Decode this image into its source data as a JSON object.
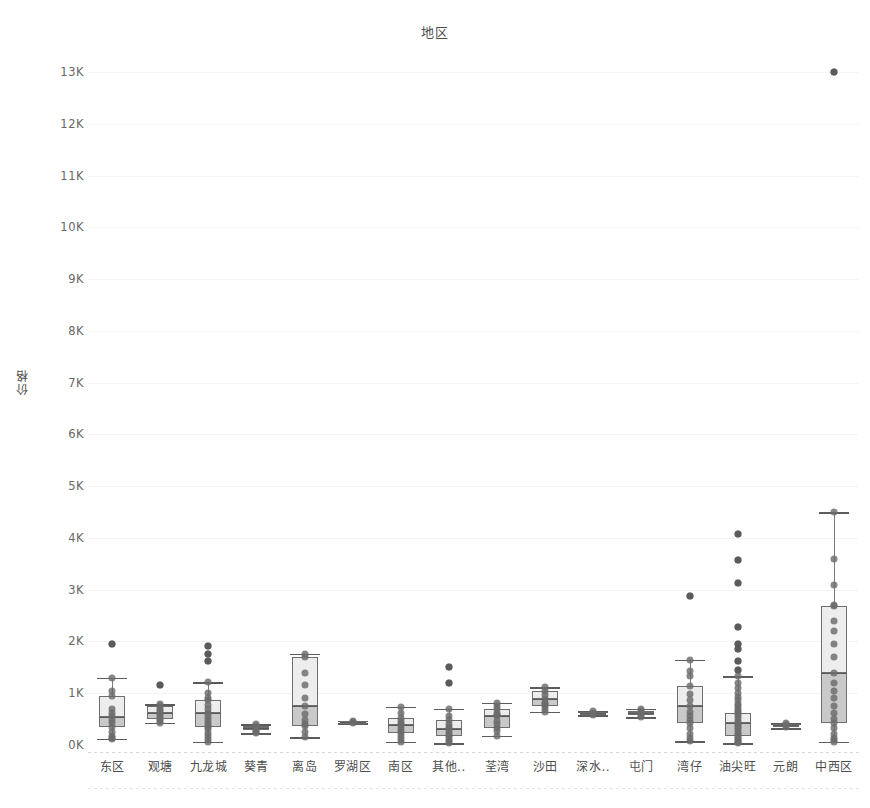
{
  "chart_data": {
    "type": "box",
    "title": "地区",
    "xlabel": "",
    "ylabel": "价格",
    "ylim": [
      0,
      13500
    ],
    "ytick_labels": [
      "13K",
      "12K",
      "11K",
      "10K",
      "9K",
      "8K",
      "7K",
      "6K",
      "5K",
      "4K",
      "3K",
      "2K",
      "1K",
      "0K"
    ],
    "ytick_values": [
      13000,
      12000,
      11000,
      10000,
      9000,
      8000,
      7000,
      6000,
      5000,
      4000,
      3000,
      2000,
      1000,
      0
    ],
    "grid": true,
    "legend": "none",
    "categories": [
      "东区",
      "观塘",
      "九龙城",
      "葵青",
      "离岛",
      "罗湖区",
      "南区",
      "其他..",
      "荃湾",
      "沙田",
      "深水..",
      "屯门",
      "湾仔",
      "油尖旺",
      "元朗",
      "中西区"
    ],
    "boxes": [
      {
        "category": "东区",
        "whisker_low": 120,
        "q1": 350,
        "median": 550,
        "q3": 950,
        "whisker_high": 1300,
        "outliers": [
          1950
        ],
        "points": [
          1950,
          1300,
          1050,
          950,
          700,
          620,
          560,
          480,
          430,
          350,
          250,
          180,
          140,
          120
        ]
      },
      {
        "category": "观塘",
        "whisker_low": 430,
        "q1": 510,
        "median": 620,
        "q3": 760,
        "whisker_high": 790,
        "outliers": [
          1150
        ],
        "points": [
          1150,
          790,
          760,
          700,
          650,
          620,
          580,
          530,
          510,
          460,
          430
        ]
      },
      {
        "category": "九龙城",
        "whisker_low": 60,
        "q1": 350,
        "median": 620,
        "q3": 860,
        "whisker_high": 1210,
        "outliers": [
          1910,
          1760,
          1620
        ],
        "points": [
          1910,
          1760,
          1620,
          1210,
          1000,
          900,
          860,
          780,
          700,
          620,
          560,
          500,
          440,
          380,
          350,
          300,
          230,
          170,
          110,
          60
        ]
      },
      {
        "category": "葵青",
        "whisker_low": 230,
        "q1": 290,
        "median": 320,
        "q3": 360,
        "whisker_high": 400,
        "outliers": [],
        "points": [
          400,
          360,
          330,
          320,
          300,
          290,
          260,
          230
        ]
      },
      {
        "category": "离岛",
        "whisker_low": 150,
        "q1": 370,
        "median": 760,
        "q3": 1700,
        "whisker_high": 1760,
        "outliers": [],
        "points": [
          1760,
          1700,
          1400,
          1150,
          900,
          760,
          600,
          480,
          400,
          370,
          260,
          150
        ]
      },
      {
        "category": "罗湖区",
        "whisker_low": 420,
        "q1": 430,
        "median": 450,
        "q3": 460,
        "whisker_high": 470,
        "outliers": [],
        "points": [
          470,
          450,
          430
        ]
      },
      {
        "category": "南区",
        "whisker_low": 60,
        "q1": 230,
        "median": 380,
        "q3": 520,
        "whisker_high": 740,
        "outliers": [],
        "points": [
          740,
          620,
          520,
          470,
          400,
          380,
          320,
          280,
          230,
          180,
          120,
          60
        ]
      },
      {
        "category": "其他..",
        "whisker_low": 40,
        "q1": 170,
        "median": 300,
        "q3": 480,
        "whisker_high": 700,
        "outliers": [
          1500,
          1200
        ],
        "points": [
          1500,
          1200,
          700,
          560,
          480,
          400,
          340,
          300,
          250,
          200,
          170,
          120,
          80,
          40
        ]
      },
      {
        "category": "荃湾",
        "whisker_low": 180,
        "q1": 330,
        "median": 560,
        "q3": 700,
        "whisker_high": 820,
        "outliers": [],
        "points": [
          820,
          760,
          700,
          620,
          580,
          560,
          470,
          400,
          330,
          270,
          180
        ]
      },
      {
        "category": "沙田",
        "whisker_low": 640,
        "q1": 760,
        "median": 880,
        "q3": 1050,
        "whisker_high": 1120,
        "outliers": [],
        "points": [
          1120,
          1050,
          960,
          880,
          820,
          790,
          760,
          700,
          640
        ]
      },
      {
        "category": "深水..",
        "whisker_low": 580,
        "q1": 595,
        "median": 615,
        "q3": 630,
        "whisker_high": 650,
        "outliers": [],
        "points": [
          650,
          615,
          580
        ]
      },
      {
        "category": "屯门",
        "whisker_low": 540,
        "q1": 580,
        "median": 620,
        "q3": 660,
        "whisker_high": 700,
        "outliers": [],
        "points": [
          700,
          660,
          620,
          580,
          540
        ]
      },
      {
        "category": "湾仔",
        "whisker_low": 70,
        "q1": 430,
        "median": 760,
        "q3": 1140,
        "whisker_high": 1650,
        "outliers": [
          2880
        ],
        "points": [
          2880,
          1650,
          1420,
          1330,
          1140,
          980,
          860,
          760,
          640,
          560,
          480,
          430,
          330,
          220,
          140,
          70
        ]
      },
      {
        "category": "油尖旺",
        "whisker_low": 30,
        "q1": 180,
        "median": 420,
        "q3": 620,
        "whisker_high": 1330,
        "outliers": [
          4080,
          3580,
          3120,
          2280,
          1960,
          1850,
          1620,
          1450
        ],
        "points": [
          4080,
          3580,
          3120,
          2280,
          1960,
          1850,
          1620,
          1450,
          1330,
          1200,
          1100,
          1000,
          930,
          860,
          800,
          760,
          700,
          650,
          620,
          580,
          520,
          470,
          430,
          390,
          340,
          300,
          260,
          220,
          180,
          140,
          110,
          80,
          50,
          30
        ]
      },
      {
        "category": "元朗",
        "whisker_low": 330,
        "q1": 355,
        "median": 380,
        "q3": 400,
        "whisker_high": 420,
        "outliers": [],
        "points": [
          420,
          380,
          350
        ]
      },
      {
        "category": "中西区",
        "whisker_low": 60,
        "q1": 430,
        "median": 1400,
        "q3": 2680,
        "whisker_high": 4500,
        "outliers": [
          13000
        ],
        "points": [
          13000,
          4500,
          3600,
          3100,
          2700,
          2680,
          2400,
          2200,
          1950,
          1700,
          1400,
          1200,
          1050,
          900,
          760,
          620,
          500,
          430,
          320,
          220,
          140,
          90,
          60
        ]
      }
    ]
  }
}
